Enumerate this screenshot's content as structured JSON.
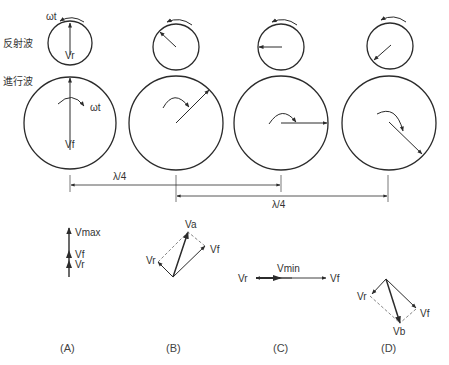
{
  "labels": {
    "reflected_wave": "反射波",
    "traveling_wave": "進行波",
    "omega_t_small": "ωt",
    "omega_t_big": "ωt",
    "vr_phasor": "Vr",
    "vf_phasor": "Vf",
    "quarter_wave_1": "λ/4",
    "quarter_wave_2": "λ/4"
  },
  "columns": [
    {
      "id": "A",
      "caption": "(A)",
      "vectors": {
        "resultant": "Vmax",
        "forward": "Vf",
        "reflected": "Vr"
      }
    },
    {
      "id": "B",
      "caption": "(B)",
      "vectors": {
        "resultant": "Va",
        "forward": "Vf",
        "reflected": "Vr"
      }
    },
    {
      "id": "C",
      "caption": "(C)",
      "vectors": {
        "resultant": "Vmin",
        "forward": "Vf",
        "reflected": "Vr"
      }
    },
    {
      "id": "D",
      "caption": "(D)",
      "vectors": {
        "resultant": "Vb",
        "forward": "Vf",
        "reflected": "Vr"
      }
    }
  ],
  "colors": {
    "line": "#2b2b2b",
    "text": "#333333",
    "dashed": "#666666"
  }
}
